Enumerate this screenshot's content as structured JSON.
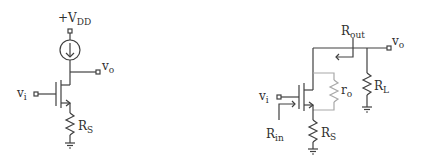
{
  "diagram_title": "Source follower with current-source load and source degeneration",
  "left_circuit": {
    "supply_label": "+V",
    "supply_sub": "DD",
    "input_label": "v",
    "input_sub": "i",
    "output_label": "v",
    "output_sub": "o",
    "source_resistor_label": "R",
    "source_resistor_sub": "S"
  },
  "right_circuit": {
    "input_label": "v",
    "input_sub": "i",
    "output_label": "v",
    "output_sub": "o",
    "rout_label": "R",
    "rout_sub": "out",
    "rin_label": "R",
    "rin_sub": "in",
    "ro_label": "r",
    "ro_sub": "o",
    "load_resistor_label": "R",
    "load_resistor_sub": "L",
    "source_resistor_label": "R",
    "source_resistor_sub": "S"
  },
  "colors": {
    "wire": "#404040",
    "small_signal_ro": "#a8a8a8",
    "background": "#ffffff"
  }
}
